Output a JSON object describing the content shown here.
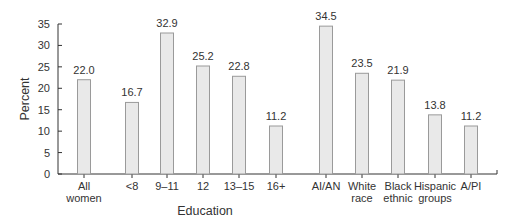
{
  "chart_data": {
    "type": "bar",
    "title": "",
    "xlabel": "Education",
    "ylabel": "Percent",
    "ylim": [
      0,
      35
    ],
    "yticks": [
      0,
      5,
      10,
      15,
      20,
      25,
      30,
      35
    ],
    "grid": false,
    "legend": null,
    "categories": [
      "All women",
      "<8",
      "9–11",
      "12",
      "13–15",
      "16+",
      "AI/AN",
      "White race",
      "Black ethnic",
      "Hispanic groups",
      "A/PI"
    ],
    "category_lines": [
      [
        "All",
        "women"
      ],
      [
        "<8"
      ],
      [
        "9–11"
      ],
      [
        "12"
      ],
      [
        "13–15"
      ],
      [
        "16+"
      ],
      [
        "AI/AN"
      ],
      [
        "White",
        "race"
      ],
      [
        "Black",
        "ethnic"
      ],
      [
        "Hispanic",
        "groups"
      ],
      [
        "A/PI"
      ]
    ],
    "values": [
      22.0,
      16.7,
      32.9,
      25.2,
      22.8,
      11.2,
      34.5,
      23.5,
      21.9,
      13.8,
      11.2
    ],
    "value_labels": [
      "22.0",
      "16.7",
      "32.9",
      "25.2",
      "22.8",
      "11.2",
      "34.5",
      "23.5",
      "21.9",
      "13.8",
      "11.2"
    ],
    "bar_fill": "#e9e9e9",
    "bar_stroke": "#9a9a9a"
  }
}
